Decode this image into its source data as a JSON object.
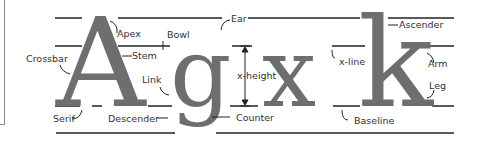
{
  "diagram": {
    "glyphs": [
      "A",
      "g",
      "x",
      "k"
    ],
    "labels": {
      "apex": "Apex",
      "bowl": "Bowl",
      "ear": "Ear",
      "ascender": "Ascender",
      "crossbar": "Crossbar",
      "stem": "Stem",
      "link": "Link",
      "x_height": "x-height",
      "x_line": "x-line",
      "arm": "Arm",
      "leg": "Leg",
      "serif": "Serif",
      "descender": "Descender",
      "counter": "Counter",
      "baseline": "Baseline"
    },
    "colors": {
      "glyph": "#6e6e6e",
      "line": "#222222",
      "text": "#333333"
    }
  }
}
